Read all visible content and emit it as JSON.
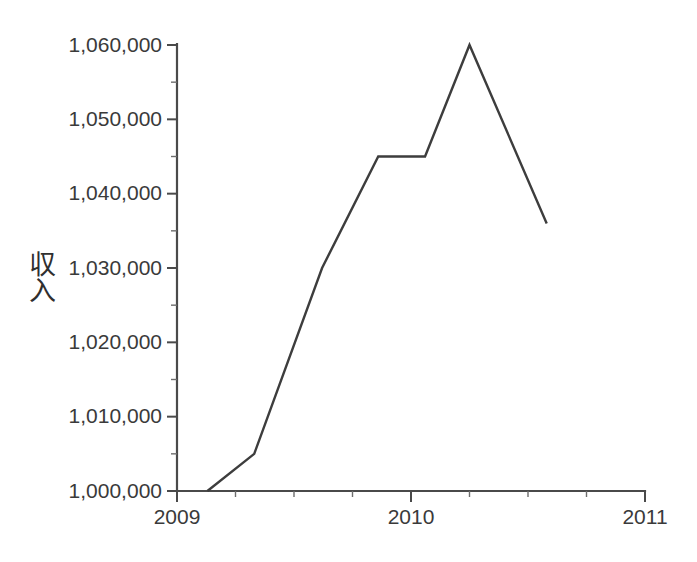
{
  "chart_data": {
    "type": "line",
    "title": "",
    "xlabel": "",
    "ylabel": "収入",
    "ylabel_chars": [
      "収",
      "入"
    ],
    "xlim": [
      2009.0,
      2011.0
    ],
    "ylim": [
      1000000,
      1060000
    ],
    "grid": false,
    "legend": null,
    "line_color": "#3d3d3d",
    "axis_color": "#4a4a4a",
    "background_color": "#ffffff",
    "y_ticks": [
      1000000,
      1010000,
      1020000,
      1030000,
      1040000,
      1050000,
      1060000
    ],
    "y_tick_labels": [
      "1,000,000",
      "1,010,000",
      "1,020,000",
      "1,030,000",
      "1,040,000",
      "1,050,000",
      "1,060,000"
    ],
    "y_minor_ticks": [
      1005000,
      1015000,
      1025000,
      1035000,
      1045000,
      1055000
    ],
    "x_ticks": [
      2009,
      2010,
      2011
    ],
    "x_tick_labels": [
      "2009",
      "2010",
      "2011"
    ],
    "x_minor_ticks": [
      2009.25,
      2009.5,
      2009.75,
      2010.25,
      2010.5,
      2010.75
    ],
    "series": [
      {
        "name": "収入",
        "x": [
          2009.13,
          2009.33,
          2009.62,
          2009.86,
          2010.06,
          2010.25,
          2010.58
        ],
        "y": [
          1000000,
          1005000,
          1030000,
          1045000,
          1045000,
          1060000,
          1036000
        ],
        "points": [
          {
            "x": 2009.13,
            "y": 1000000
          },
          {
            "x": 2009.33,
            "y": 1005000
          },
          {
            "x": 2009.62,
            "y": 1030000
          },
          {
            "x": 2009.86,
            "y": 1045000
          },
          {
            "x": 2010.06,
            "y": 1045000
          },
          {
            "x": 2010.25,
            "y": 1060000
          },
          {
            "x": 2010.58,
            "y": 1036000
          }
        ]
      }
    ]
  }
}
